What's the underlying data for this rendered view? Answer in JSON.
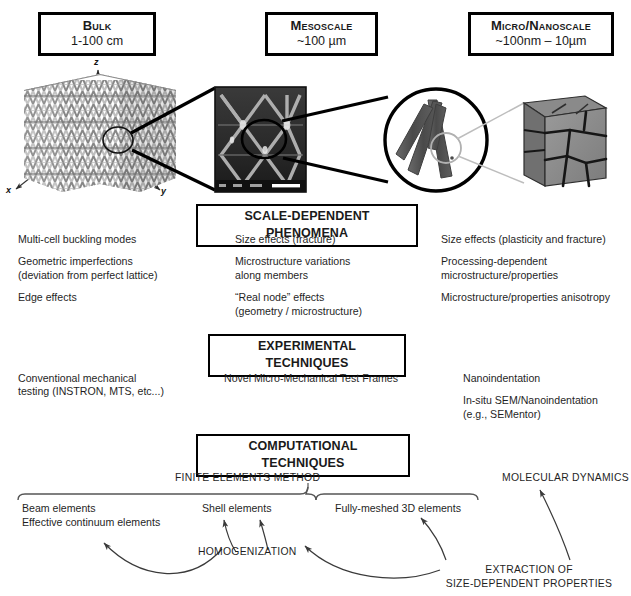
{
  "figure": {
    "ink_color": "#1a1a1a",
    "box_border_color": "#000000",
    "background": "#ffffff"
  },
  "scales": [
    {
      "id": "bulk",
      "title": "Bulk",
      "range": "1-100 cm"
    },
    {
      "id": "meso",
      "title": "Mesoscale",
      "range": "~100 µm"
    },
    {
      "id": "micro",
      "title": "Micro/Nanoscale",
      "range": "~100nm – 10µm"
    }
  ],
  "axes": {
    "x": "x",
    "y": "y",
    "z": "z"
  },
  "images": [
    {
      "id": "bulk-lattice",
      "caption": "octet truss lattice render"
    },
    {
      "id": "meso-sem",
      "caption": "SEM micrograph of lattice unit cells"
    },
    {
      "id": "strut-node-circle",
      "caption": "magnified strut / node junction"
    },
    {
      "id": "grain-cube",
      "caption": "nanoscale grain microstructure cube"
    }
  ],
  "sections": [
    {
      "id": "scale-dependent-phenomena",
      "header": "SCALE-DEPENDENT PHENOMENA",
      "columns": [
        {
          "id": "bulk",
          "items": [
            "Multi-cell buckling modes",
            "Geometric imperfections\n(deviation from perfect lattice)",
            "Edge effects"
          ]
        },
        {
          "id": "meso",
          "items": [
            "Size effects (fracture)",
            "Microstructure variations\nalong members",
            "“Real node” effects\n(geometry / microstructure)"
          ]
        },
        {
          "id": "micro",
          "items": [
            "Size effects (plasticity and fracture)",
            "Processing-dependent\nmicrostructure/properties",
            "Microstructure/properties anisotropy"
          ]
        }
      ]
    },
    {
      "id": "experimental-techniques",
      "header": "EXPERIMENTAL TECHNIQUES",
      "columns": [
        {
          "id": "bulk",
          "items": [
            "Conventional mechanical\ntesting (INSTRON, MTS, etc...)"
          ]
        },
        {
          "id": "meso",
          "items": [
            "Novel Micro-Mechanical Test Frames"
          ]
        },
        {
          "id": "micro",
          "items": [
            "Nanoindentation",
            "In-situ SEM/Nanoindentation\n(e.g., SEMentor)"
          ]
        }
      ]
    },
    {
      "id": "computational-techniques",
      "header": "COMPUTATIONAL TECHNIQUES",
      "groups": [
        {
          "id": "finite-elements-method",
          "label": "FINITE ELEMENTS METHOD",
          "members": [
            "Beam elements",
            "Effective continuum elements",
            "Shell elements",
            "Fully-meshed 3D elements"
          ]
        },
        {
          "id": "molecular-dynamics",
          "label": "MOLECULAR DYNAMICS",
          "members": []
        }
      ],
      "annotations": [
        {
          "id": "homogenization",
          "label": "HOMOGENIZATION"
        },
        {
          "id": "extraction-of-size-dependent-properties",
          "line1": "EXTRACTION OF",
          "line2": "SIZE-DEPENDENT PROPERTIES"
        }
      ]
    }
  ],
  "fem_elements": {
    "beam": "Beam elements",
    "effective_continuum": "Effective continuum elements",
    "shell": "Shell elements",
    "fully_meshed": "Fully-meshed 3D elements"
  }
}
